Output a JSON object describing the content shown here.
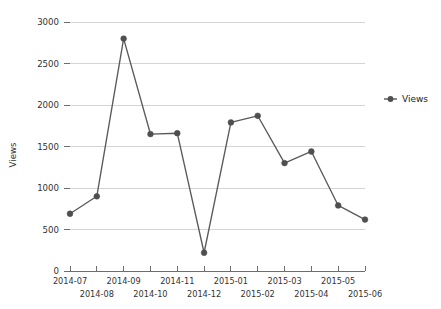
{
  "chart_data": {
    "type": "line",
    "title": "",
    "xlabel": "",
    "ylabel": "Views",
    "ylim": [
      0,
      3000
    ],
    "ytick_step": 500,
    "grid": true,
    "legend_position": "right",
    "categories": [
      "2014-07",
      "2014-08",
      "2014-09",
      "2014-10",
      "2014-11",
      "2014-12",
      "2015-01",
      "2015-02",
      "2015-03",
      "2015-04",
      "2015-05",
      "2015-06"
    ],
    "ytick_labels": [
      "0",
      "500",
      "1000",
      "1500",
      "2000",
      "2500",
      "3000"
    ],
    "ytick_values": [
      0,
      500,
      1000,
      1500,
      2000,
      2500,
      3000
    ],
    "series": [
      {
        "name": "Views",
        "color": "#4f4f4f",
        "marker": "circle",
        "values": [
          690,
          900,
          2800,
          1650,
          1660,
          220,
          1790,
          1870,
          1300,
          1440,
          790,
          620
        ]
      }
    ]
  },
  "legend": {
    "entries": [
      {
        "label": "Views",
        "color": "#4f4f4f"
      }
    ]
  },
  "axes": {
    "y_title": "Views"
  }
}
